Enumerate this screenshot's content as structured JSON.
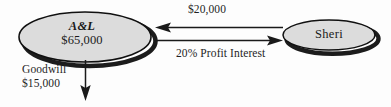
{
  "diagram": {
    "type": "entity-flow-diagram",
    "background_color": "#fdfdfd",
    "nodes": [
      {
        "id": "al",
        "shape": "ellipse",
        "title": "A&L",
        "value": "$65,000",
        "fill_color": "#dcdcdc",
        "stroke_color": "#111111",
        "shadow_color": "#1a1a1a"
      },
      {
        "id": "sheri",
        "shape": "ellipse",
        "title": "Sheri",
        "value": "",
        "fill_color": "#dcdcdc",
        "stroke_color": "#111111",
        "shadow_color": "#1a1a1a"
      }
    ],
    "edges": [
      {
        "id": "cash-to-al",
        "label": "$20,000",
        "direction": "sheri-to-al",
        "arrow_side": "left"
      },
      {
        "id": "interest-to-sheri",
        "label": "20% Profit Interest",
        "direction": "al-to-sheri",
        "arrow_side": "right"
      },
      {
        "id": "goodwill-out",
        "label_line1": "Goodwill",
        "label_line2": "$15,000",
        "direction": "downward",
        "arrow_side": "down"
      }
    ]
  }
}
